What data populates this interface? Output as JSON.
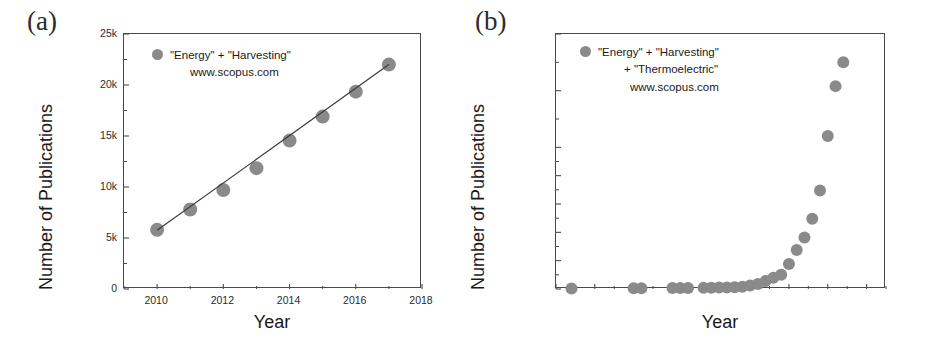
{
  "figure": {
    "panels": [
      {
        "label": "(a)",
        "legend": {
          "marker_color": "#8a8a8a",
          "lines": [
            "\"Energy\" + \"Harvesting\"",
            "www.scopus.com"
          ]
        }
      },
      {
        "label": "(b)",
        "legend": {
          "marker_color": "#8a8a8a",
          "lines": [
            "\"Energy\" + \"Harvesting\"",
            "+ \"Thermoelectric\"",
            "www.scopus.com"
          ]
        }
      }
    ]
  },
  "chart_data": [
    {
      "type": "scatter",
      "title": "",
      "xlabel": "Year",
      "ylabel": "Number of Publications",
      "xlim": [
        2009,
        2018
      ],
      "ylim": [
        0,
        25000
      ],
      "grid": false,
      "legend_position": "top-left",
      "xticks": [
        2010,
        2012,
        2014,
        2016,
        2018
      ],
      "xticklabels": [
        "2010",
        "2012",
        "2014",
        "2016",
        "2018"
      ],
      "xminorticks": [
        2009,
        2011,
        2013,
        2015,
        2017
      ],
      "yticks": [
        0,
        5000,
        10000,
        15000,
        20000,
        25000
      ],
      "yticklabels": [
        "0",
        "5k",
        "10k",
        "15k",
        "20k",
        "25k"
      ],
      "yminorticks": [
        2500,
        7500,
        12500,
        17500,
        22500
      ],
      "series": [
        {
          "name": "\"Energy\" + \"Harvesting\"",
          "marker": "circle",
          "color": "#8a8a8a",
          "x": [
            2010,
            2011,
            2012,
            2013,
            2014,
            2015,
            2016,
            2017
          ],
          "values": [
            5800,
            7800,
            9700,
            11850,
            14550,
            16900,
            19350,
            22000
          ]
        },
        {
          "name": "linear fit",
          "type": "line",
          "color": "#3a3a3a",
          "x": [
            2010,
            2017
          ],
          "values": [
            5750,
            22000
          ]
        }
      ]
    },
    {
      "type": "scatter",
      "title": "",
      "xlabel": "Year",
      "ylabel": "Number of Publications",
      "xlim": [
        1980,
        2022.5
      ],
      "ylim": [
        0,
        2250
      ],
      "grid": false,
      "legend_position": "top-left",
      "xticks": [
        1980,
        1985,
        1990,
        1995,
        2000,
        2005,
        2010,
        2015,
        2020
      ],
      "xticklabels": [
        "1980",
        "1985",
        "1990",
        "1995",
        "2000",
        "2005",
        "2010",
        "2015",
        "2020"
      ],
      "yticks": [
        0,
        250,
        500,
        750,
        1000,
        1250,
        1750,
        2250
      ],
      "yticklabels": [
        "0",
        "250",
        "500",
        "750",
        "1k",
        "1k",
        "2k",
        "2k"
      ],
      "series": [
        {
          "name": "\"Energy\" + \"Harvesting\" + \"Thermoelectric\"",
          "marker": "circle",
          "color": "#8a8a8a",
          "x": [
            1982,
            1990,
            1991,
            1995,
            1996,
            1997,
            1999,
            2000,
            2001,
            2002,
            2003,
            2004,
            2005,
            2006,
            2007,
            2008,
            2009,
            2010,
            2011,
            2012,
            2013,
            2014,
            2015,
            2016,
            2017
          ],
          "values": [
            5,
            6,
            7,
            8,
            9,
            8,
            10,
            12,
            13,
            14,
            15,
            20,
            30,
            45,
            70,
            100,
            125,
            220,
            345,
            455,
            620,
            870,
            1350,
            1790,
            2000
          ]
        }
      ]
    }
  ]
}
